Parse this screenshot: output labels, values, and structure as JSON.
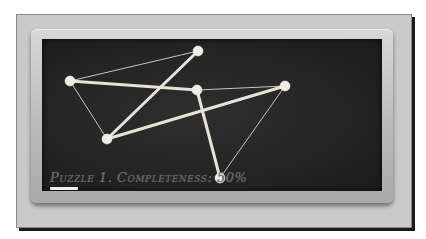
{
  "caption": "Puzzle 1. Completeness: 50%",
  "puzzle": {
    "number": 1,
    "completeness_percent": 50
  },
  "colors": {
    "board": "#262626",
    "frame": "#c0c0c0",
    "chalk": "#e8e2d6"
  },
  "nodes": [
    {
      "id": "A",
      "x": 28,
      "y": 42
    },
    {
      "id": "B",
      "x": 156,
      "y": 12
    },
    {
      "id": "C",
      "x": 155,
      "y": 51
    },
    {
      "id": "D",
      "x": 243,
      "y": 47
    },
    {
      "id": "E",
      "x": 65,
      "y": 100
    },
    {
      "id": "F",
      "x": 178,
      "y": 139
    }
  ],
  "edges": [
    {
      "from": "B",
      "to": "E",
      "style": "thick"
    },
    {
      "from": "A",
      "to": "C",
      "style": "thick"
    },
    {
      "from": "E",
      "to": "D",
      "style": "thick"
    },
    {
      "from": "C",
      "to": "F",
      "style": "thick"
    },
    {
      "from": "A",
      "to": "B",
      "style": "thin"
    },
    {
      "from": "A",
      "to": "E",
      "style": "thin"
    },
    {
      "from": "C",
      "to": "D",
      "style": "thin"
    },
    {
      "from": "D",
      "to": "F",
      "style": "thin"
    }
  ]
}
